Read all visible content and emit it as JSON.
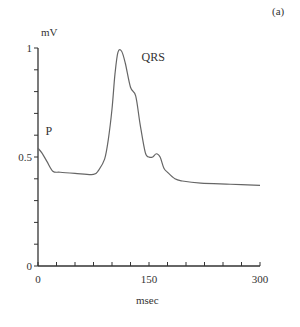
{
  "chart_data": {
    "type": "line",
    "panel_label": "(a)",
    "title": "",
    "xlabel": "msec",
    "ylabel": "mV",
    "xlim": [
      0,
      300
    ],
    "ylim": [
      0,
      1
    ],
    "x_ticks": [
      0,
      25,
      50,
      75,
      100,
      125,
      150,
      175,
      200,
      225,
      250,
      275,
      300
    ],
    "x_tick_labels": [
      "0",
      "150",
      "300"
    ],
    "y_ticks": [
      0,
      0.1,
      0.2,
      0.3,
      0.4,
      0.5,
      0.6,
      0.7,
      0.8,
      0.9,
      1.0
    ],
    "y_tick_labels": [
      "0",
      "0.5",
      "1"
    ],
    "grid": false,
    "annotations": [
      {
        "text": "P",
        "x": 10,
        "y": 0.6
      },
      {
        "text": "QRS",
        "x": 140,
        "y": 0.94
      }
    ],
    "series": [
      {
        "name": "ECG",
        "x": [
          0,
          5,
          12,
          20,
          30,
          50,
          75,
          82,
          90,
          95,
          100,
          104,
          108,
          113,
          118,
          125,
          132,
          138,
          145,
          150,
          155,
          160,
          165,
          170,
          175,
          185,
          195,
          220,
          260,
          300
        ],
        "y": [
          0.54,
          0.52,
          0.48,
          0.435,
          0.43,
          0.425,
          0.42,
          0.44,
          0.49,
          0.58,
          0.72,
          0.88,
          0.98,
          0.985,
          0.93,
          0.82,
          0.78,
          0.65,
          0.52,
          0.5,
          0.5,
          0.515,
          0.5,
          0.45,
          0.43,
          0.4,
          0.39,
          0.38,
          0.375,
          0.37
        ]
      }
    ]
  }
}
